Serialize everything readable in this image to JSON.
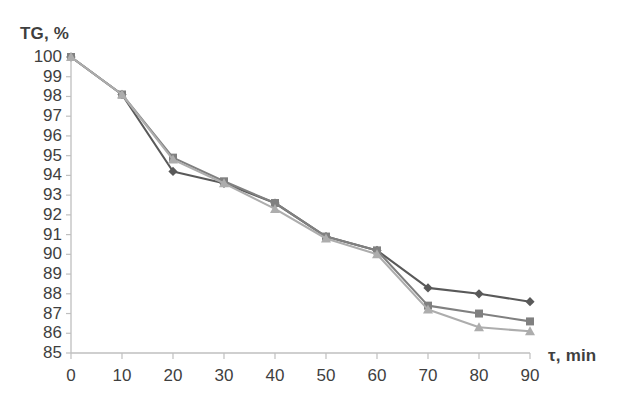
{
  "chart_data": {
    "type": "line",
    "title": "",
    "subtitle": "",
    "xlabel": "τ, min",
    "ylabel": "TG, %",
    "x": [
      0,
      10,
      20,
      30,
      40,
      50,
      60,
      70,
      80,
      90
    ],
    "xtick_labels": [
      "0",
      "10",
      "20",
      "30",
      "40",
      "50",
      "60",
      "70",
      "80",
      "90"
    ],
    "ytick_labels": [
      "100",
      "99",
      "98",
      "97",
      "96",
      "95",
      "94",
      "93",
      "92",
      "91",
      "90",
      "89",
      "88",
      "87",
      "86",
      "85"
    ],
    "xlim": [
      0,
      90
    ],
    "ylim": [
      85,
      100
    ],
    "grid": false,
    "legend": "none",
    "series": [
      {
        "name": "series-1",
        "marker": "diamond",
        "color": "#595959",
        "values": [
          100.0,
          98.1,
          94.2,
          93.6,
          92.6,
          90.9,
          90.2,
          88.3,
          88.0,
          87.6
        ]
      },
      {
        "name": "series-2",
        "marker": "square",
        "color": "#808080",
        "values": [
          100.0,
          98.1,
          94.9,
          93.7,
          92.6,
          90.9,
          90.2,
          87.4,
          87.0,
          86.6
        ]
      },
      {
        "name": "series-3",
        "marker": "triangle",
        "color": "#adadad",
        "values": [
          100.0,
          98.1,
          94.8,
          93.6,
          92.3,
          90.8,
          90.0,
          87.2,
          86.3,
          86.1
        ]
      }
    ]
  },
  "axis": {
    "line_color": "#bfbfbf",
    "tick_color": "#bfbfbf",
    "text_color": "#3f3f3f"
  }
}
